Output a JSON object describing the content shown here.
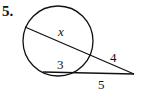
{
  "problem": {
    "number": "5.",
    "labels": {
      "inner_chord_upper": "x",
      "outer_segment_upper": "4",
      "inner_chord_lower": "3",
      "outer_segment_lower": "5"
    }
  },
  "colors": {
    "stroke": "#111111",
    "background": "#ffffff"
  }
}
